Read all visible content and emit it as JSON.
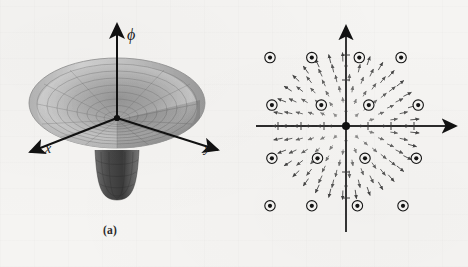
{
  "figure": {
    "panels": [
      {
        "id": "a",
        "caption": "(a)",
        "description": "mexican-hat-potential-surface",
        "axes": [
          {
            "name": "phi-axis",
            "label": "ϕ",
            "direction": "up"
          },
          {
            "name": "x-axis",
            "label": "x",
            "direction": "down-left"
          },
          {
            "name": "y-axis",
            "label": "y",
            "direction": "down-right"
          }
        ]
      },
      {
        "id": "b",
        "caption": "(b)",
        "description": "vortex-vector-field",
        "axes": [
          {
            "name": "y-axis",
            "label": "y",
            "direction": "up"
          },
          {
            "name": "x-axis",
            "label": "x",
            "direction": "right"
          }
        ],
        "point_labels": [
          {
            "name": "label-B",
            "text": "B"
          },
          {
            "name": "label-A",
            "text": "A"
          }
        ]
      }
    ]
  },
  "chart_data": {
    "type": "scatter",
    "title": "",
    "xlabel": "x",
    "ylabel": "y",
    "legend": [],
    "annotations": [
      "A",
      "B"
    ],
    "vortex_markers_xy": [
      [
        -2.0,
        1.8
      ],
      [
        -0.9,
        1.8
      ],
      [
        0.35,
        1.8
      ],
      [
        1.45,
        1.8
      ],
      [
        -1.95,
        0.55
      ],
      [
        -0.65,
        0.55
      ],
      [
        0.6,
        0.55
      ],
      [
        1.9,
        0.55
      ],
      [
        -1.95,
        -0.85
      ],
      [
        -0.75,
        -0.85
      ],
      [
        0.5,
        -0.85
      ],
      [
        1.85,
        -0.85
      ],
      [
        -2.0,
        -2.1
      ],
      [
        -0.9,
        -2.1
      ],
      [
        0.3,
        -2.1
      ],
      [
        1.5,
        -2.1
      ]
    ],
    "field_radius": 1.75,
    "field_type": "radial-outward-arrows",
    "grid": false,
    "xlim": [
      -2.6,
      2.6
    ],
    "ylim": [
      -2.6,
      2.6
    ]
  }
}
